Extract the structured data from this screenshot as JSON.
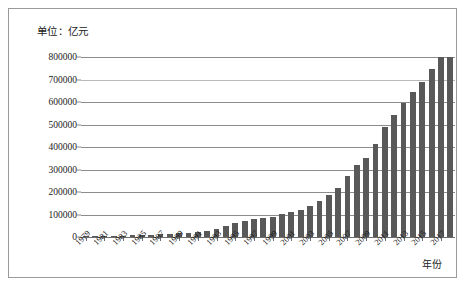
{
  "unit_label": "单位：亿元",
  "xaxis_title": "年份",
  "chart_data": {
    "type": "bar",
    "title": "",
    "subtitle": "",
    "xlabel": "年份",
    "ylabel": "单位：亿元",
    "ylim": [
      0,
      800000
    ],
    "ytick_values": [
      0,
      100000,
      200000,
      300000,
      400000,
      500000,
      600000,
      700000,
      800000
    ],
    "ytick_labels": [
      "0",
      "100000",
      "200000",
      "300000",
      "400000",
      "500000",
      "600000",
      "700000",
      "800000"
    ],
    "xtick_labels": [
      "1979",
      "1981",
      "1983",
      "1985",
      "1987",
      "1989",
      "1991",
      "1993",
      "1995",
      "1997",
      "1999",
      "2001",
      "2003",
      "2005",
      "2007",
      "2009",
      "2011",
      "2013",
      "2015",
      "2017"
    ],
    "grid": true,
    "legend": false,
    "bar_color": "#595959",
    "categories": [
      "1979",
      "1980",
      "1981",
      "1982",
      "1983",
      "1984",
      "1985",
      "1986",
      "1987",
      "1988",
      "1989",
      "1990",
      "1991",
      "1992",
      "1993",
      "1994",
      "1995",
      "1996",
      "1997",
      "1998",
      "1999",
      "2000",
      "2001",
      "2002",
      "2003",
      "2004",
      "2005",
      "2006",
      "2007",
      "2008",
      "2009",
      "2010",
      "2011",
      "2012",
      "2013",
      "2014",
      "2015",
      "2016",
      "2017",
      "2018"
    ],
    "values": [
      4100,
      4600,
      4900,
      5300,
      6000,
      7200,
      9100,
      10300,
      12100,
      15100,
      17200,
      18900,
      22000,
      27200,
      35700,
      48600,
      61300,
      71800,
      79700,
      85000,
      90600,
      100300,
      110900,
      121700,
      137400,
      161800,
      187300,
      219400,
      270200,
      319500,
      349100,
      413000,
      489300,
      540400,
      595200,
      643900,
      689000,
      746000,
      832000,
      900000
    ],
    "display_values": [
      4100,
      4600,
      4900,
      5300,
      6000,
      7200,
      9100,
      10300,
      12100,
      15100,
      17200,
      18900,
      22000,
      27200,
      35700,
      48600,
      61300,
      71800,
      79700,
      85000,
      90600,
      100300,
      110900,
      121700,
      137400,
      161800,
      187300,
      219400,
      270200,
      319500,
      349100,
      413000,
      489300,
      540400,
      595200,
      643900,
      689000,
      746000,
      832000,
      900000
    ]
  }
}
